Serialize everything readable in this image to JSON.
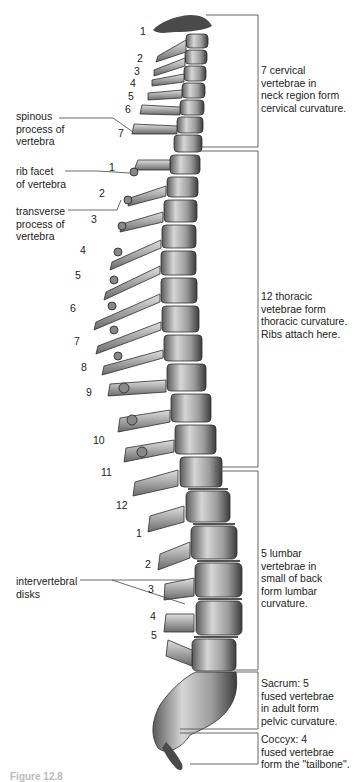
{
  "figure": {
    "caption_partial": "Figure 12.8"
  },
  "left_labels": {
    "spinous_process": "spinous\nprocess of\nvertebra",
    "rib_facet": "rib facet\nof vertebra",
    "transverse_process": "transverse\nprocess of\nvertebra",
    "intervertebral_disks": "intervertebral\ndisks"
  },
  "vertebra_numbers": {
    "cervical": [
      "1",
      "2",
      "3",
      "4",
      "5",
      "6",
      "7"
    ],
    "thoracic": [
      "1",
      "2",
      "3",
      "4",
      "5",
      "6",
      "7",
      "8",
      "9",
      "10",
      "11",
      "12"
    ],
    "lumbar": [
      "1",
      "2",
      "3",
      "4",
      "5"
    ]
  },
  "regions": [
    {
      "name": "cervical",
      "description": "7 cervical\nvertebrae in\nneck region form\ncervical curvature."
    },
    {
      "name": "thoracic",
      "description": "12 thoracic\nvetebrae form\nthoracic curvature.\nRibs attach here."
    },
    {
      "name": "lumbar",
      "description": "5 lumbar\nvertebrae in\nsmall of back\nform lumbar\ncurvature."
    },
    {
      "name": "sacrum",
      "description": "Sacrum: 5\nfused vertebrae\nin adult form\npelvic curvature."
    },
    {
      "name": "coccyx",
      "description": "Coccyx: 4\nfused vertebrae\nform the \"tailbone\"."
    }
  ],
  "colors": {
    "bone_light": "#d8d8d8",
    "bone_mid": "#9a9a9a",
    "bone_dark": "#3a3a3a",
    "line": "#555555"
  }
}
